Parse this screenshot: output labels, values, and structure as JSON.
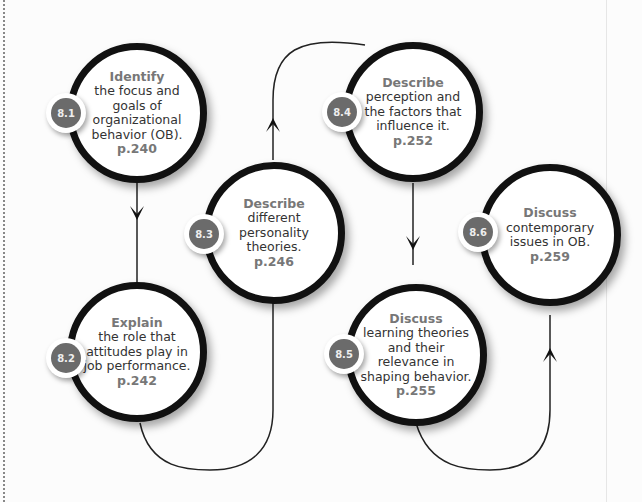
{
  "diagram": {
    "colors": {
      "ring": "#111111",
      "badge": "#6b6b6b",
      "verb": "#777777",
      "text": "#333333"
    },
    "nodes": [
      {
        "id": "8.1",
        "verb": "Identify",
        "text": "the focus and goals of organizational behavior (OB).",
        "page": "p.240"
      },
      {
        "id": "8.2",
        "verb": "Explain",
        "text": "the role that attitudes play in job performance.",
        "page": "p.242"
      },
      {
        "id": "8.3",
        "verb": "Describe",
        "text": "different personality theories.",
        "page": "p.246"
      },
      {
        "id": "8.4",
        "verb": "Describe",
        "text": "perception and the factors that influence it.",
        "page": "p.252"
      },
      {
        "id": "8.5",
        "verb": "Discuss",
        "text": "learning theories and their relevance in shaping behavior.",
        "page": "p.255"
      },
      {
        "id": "8.6",
        "verb": "Discuss",
        "text": "contemporary issues in OB.",
        "page": "p.259"
      }
    ],
    "flow": [
      "8.1",
      "8.2",
      "8.3",
      "8.4",
      "8.5",
      "8.6"
    ]
  }
}
